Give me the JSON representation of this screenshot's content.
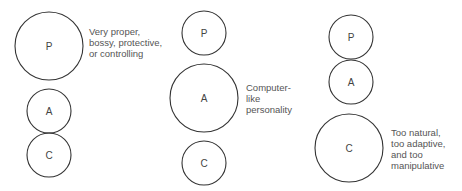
{
  "figures": [
    {
      "id": "controlling-parent",
      "circles": [
        {
          "label": "P",
          "cx": 49,
          "cy": 46,
          "r": 34
        },
        {
          "label": "A",
          "cx": 49,
          "cy": 111,
          "r": 22
        },
        {
          "label": "C",
          "cx": 49,
          "cy": 155,
          "r": 22
        }
      ],
      "caption": [
        "Very proper,",
        "bossy, protective,",
        "or controlling"
      ]
    },
    {
      "id": "computer-adult",
      "circles": [
        {
          "label": "P",
          "cx": 204,
          "cy": 33,
          "r": 22
        },
        {
          "label": "A",
          "cx": 204,
          "cy": 98,
          "r": 34
        },
        {
          "label": "C",
          "cx": 204,
          "cy": 163,
          "r": 22
        }
      ],
      "caption": [
        "Computer-",
        "like",
        "personality"
      ]
    },
    {
      "id": "manipulative-child",
      "circles": [
        {
          "label": "P",
          "cx": 351,
          "cy": 37,
          "r": 22
        },
        {
          "label": "A",
          "cx": 351,
          "cy": 82,
          "r": 22
        },
        {
          "label": "C",
          "cx": 349,
          "cy": 148,
          "r": 34
        }
      ],
      "caption": [
        "Too natural,",
        "too adaptive,",
        "and too",
        "manipulative"
      ]
    }
  ]
}
